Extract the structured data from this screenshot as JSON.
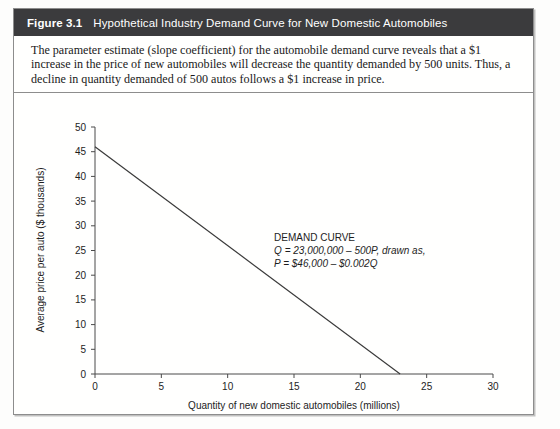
{
  "figure": {
    "number": "Figure 3.1",
    "title": "Hypothetical Industry Demand Curve for New Domestic Automobiles",
    "caption": "The parameter estimate (slope coefficient) for the automobile demand curve reveals that a $1 increase in the price of new automobiles will decrease the quantity demanded by 500 units. Thus, a decline in quantity demanded of 500 autos follows a $1 increase in price.",
    "header_bg": "#3b3b3d",
    "header_fg": "#ffffff",
    "border_color": "#8d8d8d"
  },
  "chart_data": {
    "type": "line",
    "title": "",
    "xlabel": "Quantity of new domestic automobiles (millions)",
    "ylabel": "Average price per auto ($ thousands)",
    "xlim": [
      0,
      30
    ],
    "ylim": [
      0,
      50
    ],
    "xticks": [
      0,
      5,
      10,
      15,
      20,
      25,
      30
    ],
    "yticks": [
      0,
      5,
      10,
      15,
      20,
      25,
      30,
      35,
      40,
      45,
      50
    ],
    "grid": false,
    "legend": "none",
    "line_color": "#3a3a3a",
    "series": [
      {
        "name": "Demand curve",
        "x": [
          0,
          23
        ],
        "y": [
          46,
          0
        ]
      }
    ],
    "annotations": [
      {
        "name": "demand-curve-annotation",
        "x": 13.5,
        "y": 27,
        "lines": [
          "DEMAND CURVE",
          "Q = 23,000,000 – 500P, drawn as,",
          "P = $46,000 – $0.002Q"
        ]
      }
    ]
  }
}
